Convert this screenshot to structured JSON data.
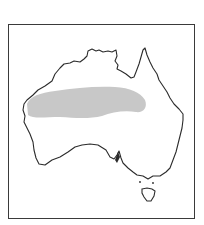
{
  "map": {
    "subject": "Australia",
    "kind": "species distribution range map",
    "colors": {
      "background": "#ffffff",
      "frame": "#3a3a3a",
      "coastline": "#2b2b2b",
      "range_fill": "#c8c8c8"
    },
    "regions": [
      {
        "name": "mainland-australia",
        "shaded": false
      },
      {
        "name": "tasmania",
        "shaded": false
      },
      {
        "name": "distribution-range",
        "shaded": true,
        "location": "central-western Australia, west coast to inland Queensland border"
      }
    ]
  }
}
